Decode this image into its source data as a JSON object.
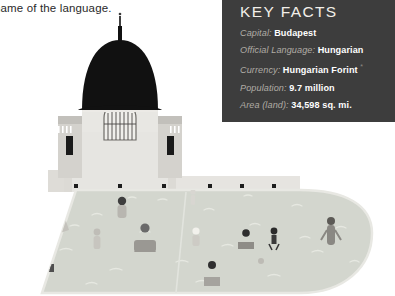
{
  "page": {
    "body_text": "name of the language."
  },
  "key_facts": {
    "title": "KEY FACTS",
    "rows": [
      {
        "label": "Capital:",
        "value": "Budapest",
        "note": ""
      },
      {
        "label": "Official Language:",
        "value": "Hungarian",
        "note": ""
      },
      {
        "label": "Currency:",
        "value": "Hungarian Forint",
        "note": "*"
      },
      {
        "label": "Population:",
        "value": "9.7 million",
        "note": ""
      },
      {
        "label": "Area (land):",
        "value": "34,598 sq. mi.",
        "note": ""
      }
    ],
    "panel_color": "#3d3d3d",
    "value_color": "#ffffff",
    "label_color": "#b0aca5"
  },
  "illustration": {
    "name": "szechenyi-thermal-bath-budapest",
    "dome_color": "#111111",
    "facade_color": "#e2e1dd",
    "facade_shadow": "#c9c8c4",
    "pool_water_color": "#d2d5cd",
    "pool_deck_color": "#eceae5",
    "figure_dark": "#4a4a4a",
    "figure_light": "#b9b7b1"
  }
}
